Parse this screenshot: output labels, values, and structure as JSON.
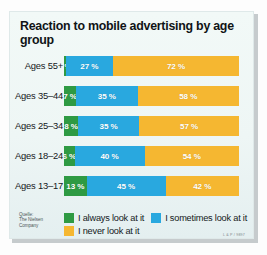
{
  "chart_data": {
    "type": "bar",
    "subtype": "stacked-horizontal-100",
    "title": "Reaction to mobile advertising by age group",
    "xlabel": "",
    "ylabel": "",
    "xlim": [
      0,
      100
    ],
    "grid": false,
    "legend_position": "bottom",
    "categories": [
      "Ages 55+",
      "Ages 35–44",
      "Ages 25–34",
      "Ages 18–24",
      "Ages 13–17"
    ],
    "series": [
      {
        "name": "I always look at it",
        "color": "#2e9a43",
        "values": [
          1,
          7,
          8,
          6,
          13
        ]
      },
      {
        "name": "I sometimes look at it",
        "color": "#29a8df",
        "values": [
          27,
          35,
          35,
          40,
          45
        ]
      },
      {
        "name": "I never look at it",
        "color": "#f5b731",
        "values": [
          72,
          58,
          57,
          54,
          42
        ]
      }
    ],
    "rows": [
      {
        "category": "Ages 55+",
        "segments": [
          {
            "series": "I always look at it",
            "value": 1,
            "label": "1 %"
          },
          {
            "series": "I sometimes look at it",
            "value": 27,
            "label": "27 %"
          },
          {
            "series": "I never look at it",
            "value": 72,
            "label": "72 %"
          }
        ]
      },
      {
        "category": "Ages 35–44",
        "segments": [
          {
            "series": "I always look at it",
            "value": 7,
            "label": "7 %"
          },
          {
            "series": "I sometimes look at it",
            "value": 35,
            "label": "35 %"
          },
          {
            "series": "I never look at it",
            "value": 58,
            "label": "58 %"
          }
        ]
      },
      {
        "category": "Ages 25–34",
        "segments": [
          {
            "series": "I always look at it",
            "value": 8,
            "label": "8 %"
          },
          {
            "series": "I sometimes look at it",
            "value": 35,
            "label": "35 %"
          },
          {
            "series": "I never look at it",
            "value": 57,
            "label": "57 %"
          }
        ]
      },
      {
        "category": "Ages 18–24",
        "segments": [
          {
            "series": "I always look at it",
            "value": 6,
            "label": "6 %"
          },
          {
            "series": "I sometimes look at it",
            "value": 40,
            "label": "40 %"
          },
          {
            "series": "I never look at it",
            "value": 54,
            "label": "54 %"
          }
        ]
      },
      {
        "category": "Ages 13–17",
        "segments": [
          {
            "series": "I always look at it",
            "value": 13,
            "label": "13 %"
          },
          {
            "series": "I sometimes look at it",
            "value": 45,
            "label": "45 %"
          },
          {
            "series": "I never look at it",
            "value": 42,
            "label": "42 %"
          }
        ]
      }
    ],
    "legend": [
      {
        "label": "I always look at it",
        "color": "#2e9a43"
      },
      {
        "label": "I sometimes look at it",
        "color": "#29a8df"
      },
      {
        "label": "I never look at it",
        "color": "#f5b731"
      }
    ],
    "source": "Quelle:\nThe Nielsen\nCompany",
    "credit": "L & P / 9897"
  },
  "colors": {
    "always": "#2e9a43",
    "sometimes": "#29a8df",
    "never": "#f5b731",
    "panel_background": "#eef6f5",
    "title_text": "#101416"
  }
}
